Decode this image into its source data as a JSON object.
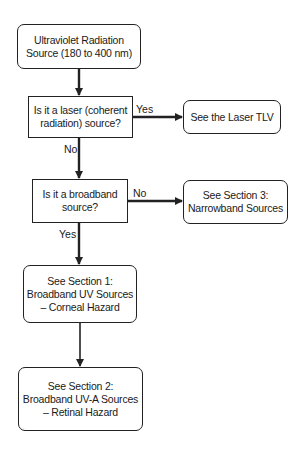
{
  "nodes": {
    "start": {
      "lines": [
        "Ultraviolet Radiation",
        "Source (180 to 400 nm)"
      ],
      "shape": "rounded"
    },
    "q_laser": {
      "lines": [
        "Is it a laser (coherent",
        "radiation) source?"
      ],
      "shape": "rectangle"
    },
    "laser_tlv": {
      "lines": [
        "See the Laser TLV"
      ],
      "shape": "rounded"
    },
    "q_broadband": {
      "lines": [
        "Is it a broadband",
        "source?"
      ],
      "shape": "rectangle"
    },
    "section3": {
      "lines": [
        "See Section 3:",
        "Narrowband Sources"
      ],
      "shape": "rounded"
    },
    "section1": {
      "lines": [
        "See Section 1:",
        "Broadband UV Sources",
        "– Corneal Hazard"
      ],
      "shape": "rounded"
    },
    "section2": {
      "lines": [
        "See Section 2:",
        "Broadband UV-A Sources",
        "– Retinal Hazard"
      ],
      "shape": "rounded"
    }
  },
  "edges": [
    {
      "from": "start",
      "to": "q_laser",
      "label": ""
    },
    {
      "from": "q_laser",
      "to": "laser_tlv",
      "label": "Yes"
    },
    {
      "from": "q_laser",
      "to": "q_broadband",
      "label": "No"
    },
    {
      "from": "q_broadband",
      "to": "section3",
      "label": "No"
    },
    {
      "from": "q_broadband",
      "to": "section1",
      "label": "Yes"
    },
    {
      "from": "section1",
      "to": "section2",
      "label": ""
    }
  ],
  "colors": {
    "line": "#222222",
    "background": "#ffffff"
  }
}
